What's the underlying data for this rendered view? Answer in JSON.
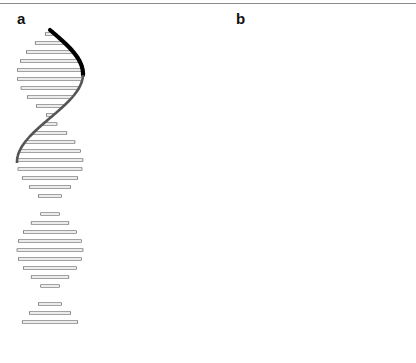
{
  "figure": {
    "panels": [
      {
        "label": "a",
        "description": "Two DNA double helices exchanging strands at a crossover junction (single strand crossing)"
      },
      {
        "label": "b",
        "description": "Two DNA double helices with a continuous strand crossing diagonally between them"
      }
    ],
    "colors": {
      "front_strand": "#000000",
      "back_strand": "#555555",
      "base_pair": "#444444",
      "rule": "#8a8a8a"
    }
  }
}
